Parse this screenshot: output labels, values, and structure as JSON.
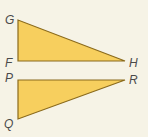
{
  "diagram": {
    "colors": {
      "background": "#f6f3e6",
      "fill": "#f7cf5e",
      "stroke": "#8a6a1c",
      "label": "#4a4a4a"
    },
    "triangles": [
      {
        "name": "FGH",
        "vertices": {
          "G": {
            "x": 18,
            "y": 20
          },
          "F": {
            "x": 18,
            "y": 61
          },
          "H": {
            "x": 125,
            "y": 61
          }
        },
        "right_angle_at": "F",
        "labels": {
          "G": {
            "text": "G",
            "x": 5,
            "y": 20
          },
          "F": {
            "text": "F",
            "x": 5,
            "y": 66
          },
          "H": {
            "text": "H",
            "x": 129,
            "y": 66
          }
        }
      },
      {
        "name": "PQR",
        "vertices": {
          "P": {
            "x": 18,
            "y": 80
          },
          "R": {
            "x": 125,
            "y": 80
          },
          "Q": {
            "x": 18,
            "y": 119
          }
        },
        "right_angle_at": "P",
        "labels": {
          "P": {
            "text": "P",
            "x": 5,
            "y": 80
          },
          "R": {
            "text": "R",
            "x": 129,
            "y": 82
          },
          "Q": {
            "text": "Q",
            "x": 4,
            "y": 127
          }
        }
      }
    ]
  }
}
